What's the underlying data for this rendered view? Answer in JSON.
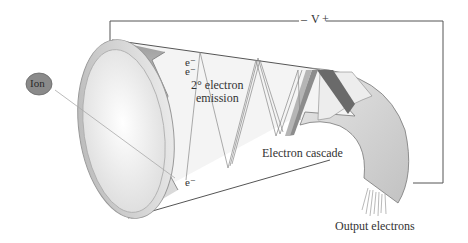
{
  "diagram": {
    "labels": {
      "voltage_minus": "–",
      "voltage": "V",
      "voltage_plus": "+",
      "ion": "Ion",
      "e1": "e⁻",
      "e2": "e⁻",
      "emission_line1": "2° electron",
      "emission_line2": "emission",
      "e3": "e⁻",
      "cascade": "Electron cascade",
      "output": "Output electrons"
    },
    "colors": {
      "ion_fill": "#8a8a8a",
      "tube_light": "#f2f2f2",
      "tube_mid": "#cfcfcf",
      "tube_dark": "#9a9a9a",
      "dark_band": "#6a6a6a",
      "line": "#555555"
    }
  }
}
